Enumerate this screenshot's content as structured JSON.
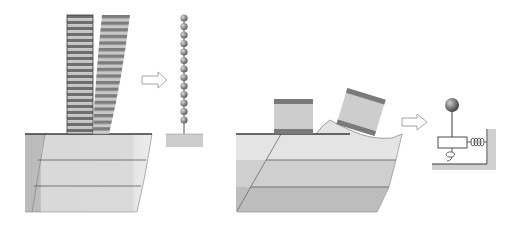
{
  "figure": {
    "colors": {
      "background": "#ffffff",
      "column_dark_band": "#6e6e6e",
      "column_light_band": "#bdbdbd",
      "column_outline": "#3c3c3c",
      "soil_light": "#e3e3e3",
      "soil_mid": "#cfcfcf",
      "soil_dark": "#b9b9b9",
      "soil_line": "#6a6a6a",
      "ground_line": "#3a3a3a",
      "bead": "#8a8a8a",
      "base_block": "#cccccc",
      "box_fill": "#cdcdcd",
      "box_band": "#7a7a7a",
      "arrow_stroke": "#9a9a9a"
    },
    "panels": [
      {
        "name": "left-panel",
        "elements": [
          "upright-banded-column",
          "leaning-banded-column",
          "layered-soil-block"
        ],
        "bead_count": 14
      },
      {
        "name": "right-panel",
        "elements": [
          "rigid-block",
          "tilted-block",
          "layered-soil-block-with-heave"
        ],
        "model": "mass-on-rod with rotational spring and translational spring to wall"
      }
    ],
    "arrows": [
      "transform-arrow-1",
      "transform-arrow-2"
    ]
  }
}
